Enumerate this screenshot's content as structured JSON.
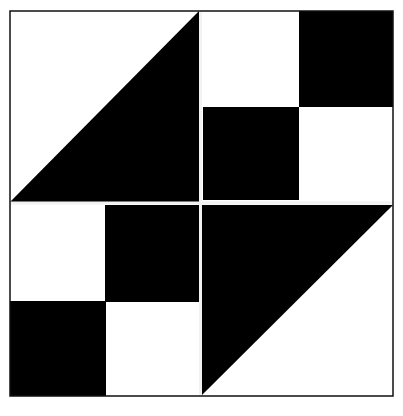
{
  "colors": {
    "dark": "#000000",
    "light": "#ffffff",
    "seam": "#f2f2f2"
  },
  "frame": {
    "x": 10,
    "y": 11,
    "x2": 393,
    "y2": 396
  },
  "center": {
    "x": 200,
    "y": 203
  },
  "quadrants": [
    {
      "name": "top-left",
      "type": "half-square-triangle",
      "dark_corner": "bottom-right"
    },
    {
      "name": "top-right",
      "type": "four-patch",
      "dark_cells": [
        "top-right",
        "bottom-left"
      ]
    },
    {
      "name": "bottom-left",
      "type": "four-patch",
      "dark_cells": [
        "top-right",
        "bottom-left"
      ]
    },
    {
      "name": "bottom-right",
      "type": "half-square-triangle",
      "dark_corner": "top-left"
    }
  ]
}
